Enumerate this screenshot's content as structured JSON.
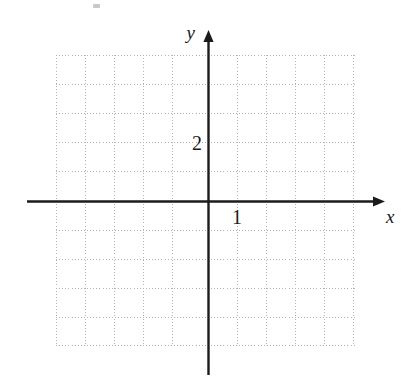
{
  "figure": {
    "kind": "cartesian-grid",
    "background_color": "#ffffff",
    "axis_color": "#1b1b1b",
    "grid_color": "#b4b4b4",
    "label_color": "#1a1a1a"
  },
  "labels": {
    "x_axis": "x",
    "y_axis": "y",
    "x_tick": "1",
    "y_tick": "2"
  },
  "chart_data": {
    "type": "line",
    "title": "",
    "subtitle": "",
    "xlabel": "x",
    "ylabel": "y",
    "grid": true,
    "legend": "none",
    "series": [],
    "annotations": [],
    "x_tick_labels": [
      "1"
    ],
    "y_tick_labels": [
      "2"
    ],
    "x_tick_values": [
      1
    ],
    "y_tick_values": [
      2
    ],
    "xlim": [
      -5.2,
      5.2
    ],
    "ylim": [
      -5.0,
      5.0
    ],
    "grid_step": 1,
    "origin_px": [
      208,
      201
    ],
    "unit_px": 29,
    "grid_extent_px": {
      "left": 56,
      "right": 357,
      "top": 55,
      "bottom": 345
    },
    "axis_extent_px": {
      "x_start": 27,
      "x_end": 385,
      "y_top": 30,
      "y_bottom": 375
    },
    "vertical_gridlines_px": [
      56,
      85,
      114,
      143,
      172,
      208,
      237,
      266,
      295,
      324,
      353
    ],
    "horizontal_gridlines_px": [
      55,
      84,
      113,
      142,
      171,
      201,
      230,
      259,
      288,
      317,
      345
    ]
  }
}
